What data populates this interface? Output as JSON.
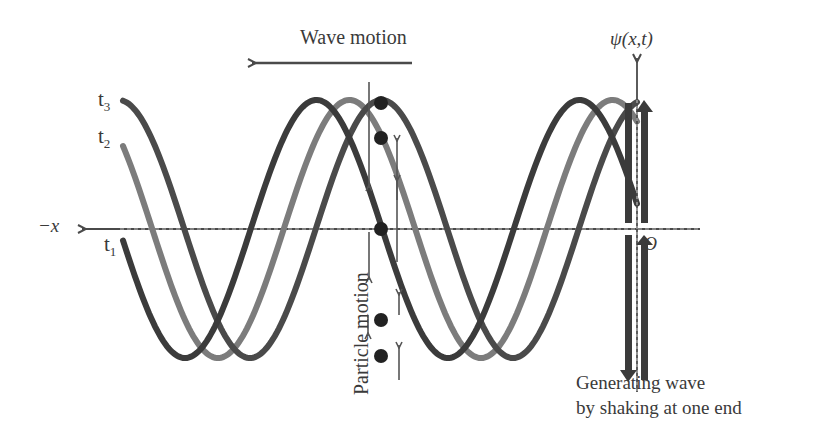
{
  "diagram": {
    "title": "Wave motion",
    "y_axis_label": "ψ(x,t)",
    "x_axis_label": "−x",
    "origin_label": "O",
    "curves": [
      {
        "label": "t",
        "sub": "3",
        "color": "#3b3b3b",
        "name": "t3"
      },
      {
        "label": "t",
        "sub": "2",
        "color": "#7c7c7c",
        "name": "t2"
      },
      {
        "label": "t",
        "sub": "1",
        "color": "#4a4a4a",
        "name": "t1"
      }
    ],
    "particle_motion_label": "Particle motion",
    "caption_line1": "Generating wave",
    "caption_line2": "by shaking at one end",
    "colors": {
      "axis": "#4a4a4a",
      "curve_dark": "#3b3b3b",
      "curve_gray": "#7c7c7c",
      "curve_mid": "#4a4a4a",
      "dot": "#222222",
      "text": "#3a3a3a"
    }
  },
  "chart_data": {
    "type": "line",
    "title": "Wave motion",
    "xlabel": "−x",
    "ylabel": "ψ(x,t)",
    "series": [
      {
        "name": "t3",
        "wavelength_px": 263,
        "amplitude_px": 129,
        "troughs_x": [
          185,
          448
        ],
        "peaks_x": [
          316,
          579
        ]
      },
      {
        "name": "t2",
        "wavelength_px": 263,
        "amplitude_px": 129,
        "troughs_x": [
          218,
          481
        ],
        "peaks_x": [
          349,
          612
        ]
      },
      {
        "name": "t1",
        "wavelength_px": 263,
        "amplitude_px": 129,
        "troughs_x": [
          250,
          513
        ],
        "peaks_x": [
          381,
          644
        ]
      }
    ],
    "annotations": [
      "Wave motion (leftward arrow)",
      "Particle motion (vertical arrows)",
      "Generating wave by shaking at one end",
      "O (origin)"
    ]
  }
}
